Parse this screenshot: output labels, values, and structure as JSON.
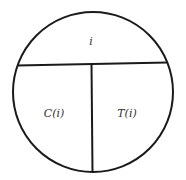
{
  "diagram": {
    "shape": "circle",
    "stroke_color": "#1a1a1a",
    "background": "#ffffff",
    "regions": {
      "top": {
        "label": "i"
      },
      "bottom_left": {
        "label": "C(i)"
      },
      "bottom_right": {
        "label": "T(i)"
      }
    }
  }
}
